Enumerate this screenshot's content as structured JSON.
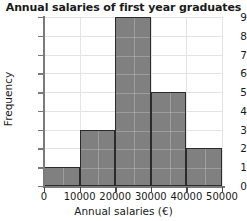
{
  "chart_data": {
    "type": "bar",
    "title": "Annual salaries of first year graduates",
    "xlabel": "Annual salaries (€)",
    "ylabel": "Frequency",
    "categories": [
      "0–10000",
      "10000–20000",
      "20000–30000",
      "30000–40000",
      "40000–50000"
    ],
    "bin_edges": [
      0,
      10000,
      20000,
      30000,
      40000,
      50000
    ],
    "values": [
      1,
      3,
      9,
      5,
      2
    ],
    "xlim": [
      0,
      50000
    ],
    "ylim": [
      0,
      9
    ],
    "x_ticks": [
      0,
      10000,
      20000,
      30000,
      40000,
      50000
    ],
    "x_tick_labels": [
      "0",
      "10000",
      "20000",
      "30000",
      "40000",
      "50000"
    ],
    "y_ticks": [
      0,
      1,
      2,
      3,
      4,
      5,
      6,
      7,
      8,
      9
    ],
    "y_tick_labels": [
      "0",
      "1",
      "2",
      "3",
      "4",
      "5",
      "6",
      "7",
      "8",
      "9"
    ],
    "grid": true,
    "legend": false,
    "bar_fill_color": "#808080",
    "bar_edge_color": "#2b2b2b",
    "grid_color": "#e4e4e4",
    "axis_color": "#7a7a7a",
    "background_color": "#ffffff"
  }
}
